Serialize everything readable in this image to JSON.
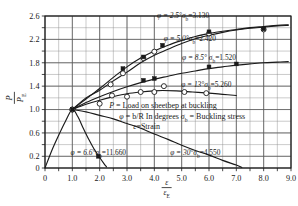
{
  "chart_data": {
    "type": "line",
    "title": "",
    "xlabel": "ε/ε_E",
    "ylabel": "P/P_E",
    "xlim": [
      0,
      9.0
    ],
    "ylim": [
      0,
      2.6
    ],
    "grid": true,
    "legend_position": "inline-annotations",
    "x_ticks": [
      "0",
      "1.0",
      "2.0",
      "3.0",
      "4.0",
      "5.0",
      "6.0",
      "7.0",
      "8.0",
      "9.0"
    ],
    "x_tick_values": [
      0,
      1,
      2,
      3,
      4,
      5,
      6,
      7,
      8,
      9
    ],
    "y_ticks": [
      "0",
      "0.2",
      "0.6",
      "1.0",
      "1.4",
      "1.8",
      "2.2",
      "2.6"
    ],
    "y_tick_values": [
      0,
      0.2,
      0.6,
      1.0,
      1.4,
      1.8,
      2.2,
      2.6
    ],
    "x_minor_step": 0.5,
    "y_minor_step": 0.2,
    "convergence_point": [
      1.0,
      1.0
    ],
    "series": [
      {
        "name": "φ = 2.5°  σb = 3.130",
        "phi_deg": 2.5,
        "sigma_b": 3.13,
        "marker": "open-circle",
        "points": [
          [
            1.0,
            1.0
          ],
          [
            2.4,
            1.43
          ],
          [
            2.85,
            1.62
          ],
          [
            3.6,
            1.88
          ],
          [
            4.0,
            1.99
          ],
          [
            6.0,
            2.3
          ],
          [
            8.0,
            2.37
          ]
        ],
        "curve": [
          [
            1.0,
            1.0
          ],
          [
            1.5,
            1.2
          ],
          [
            2.0,
            1.33
          ],
          [
            2.5,
            1.49
          ],
          [
            3.0,
            1.64
          ],
          [
            3.5,
            1.8
          ],
          [
            4.0,
            1.93
          ],
          [
            4.5,
            2.03
          ],
          [
            5.0,
            2.13
          ],
          [
            5.5,
            2.21
          ],
          [
            6.0,
            2.27
          ],
          [
            6.5,
            2.32
          ],
          [
            7.0,
            2.36
          ],
          [
            7.5,
            2.39
          ],
          [
            8.0,
            2.41
          ],
          [
            8.5,
            2.43
          ],
          [
            8.9,
            2.44
          ]
        ]
      },
      {
        "name": "φ = 5.0°  σb = 2.420",
        "phi_deg": 5.0,
        "sigma_b": 2.42,
        "marker": "filled-square",
        "points": [
          [
            1.0,
            1.0
          ],
          [
            2.85,
            1.7
          ],
          [
            3.6,
            1.9
          ],
          [
            4.3,
            2.1
          ],
          [
            6.0,
            2.33
          ],
          [
            8.0,
            2.38
          ]
        ],
        "curve": [
          [
            1.0,
            1.0
          ],
          [
            1.5,
            1.18
          ],
          [
            2.0,
            1.36
          ],
          [
            2.5,
            1.55
          ],
          [
            3.0,
            1.73
          ],
          [
            3.5,
            1.88
          ],
          [
            4.0,
            2.0
          ],
          [
            4.5,
            2.1
          ],
          [
            5.0,
            2.18
          ],
          [
            5.5,
            2.25
          ],
          [
            6.0,
            2.3
          ],
          [
            6.5,
            2.34
          ],
          [
            7.0,
            2.37
          ],
          [
            7.5,
            2.4
          ],
          [
            8.0,
            2.42
          ],
          [
            8.5,
            2.44
          ],
          [
            8.9,
            2.45
          ]
        ]
      },
      {
        "name": "φ = 8.5°  σb = 1.520",
        "phi_deg": 8.5,
        "sigma_b": 1.52,
        "marker": "filled-square",
        "points": [
          [
            1.0,
            1.0
          ],
          [
            3.6,
            1.5
          ],
          [
            4.0,
            1.53
          ],
          [
            6.0,
            1.73
          ],
          [
            7.0,
            1.78
          ]
        ],
        "curve": [
          [
            1.0,
            1.0
          ],
          [
            1.5,
            1.12
          ],
          [
            2.0,
            1.22
          ],
          [
            2.5,
            1.31
          ],
          [
            3.0,
            1.39
          ],
          [
            3.5,
            1.46
          ],
          [
            4.0,
            1.52
          ],
          [
            4.5,
            1.57
          ],
          [
            5.0,
            1.62
          ],
          [
            5.5,
            1.66
          ],
          [
            6.0,
            1.7
          ],
          [
            6.5,
            1.73
          ],
          [
            7.0,
            1.76
          ],
          [
            7.5,
            1.78
          ],
          [
            8.0,
            1.8
          ],
          [
            8.5,
            1.81
          ],
          [
            8.9,
            1.82
          ]
        ]
      },
      {
        "name": "φ = 13°  σb = 5.260",
        "phi_deg": 13,
        "sigma_b": 5.26,
        "marker": "open-circle",
        "points": [
          [
            1.0,
            1.0
          ],
          [
            2.0,
            1.1
          ],
          [
            2.45,
            1.24
          ],
          [
            3.0,
            1.22
          ],
          [
            3.5,
            1.3
          ],
          [
            4.0,
            1.3
          ],
          [
            4.35,
            1.4
          ],
          [
            5.1,
            1.3
          ],
          [
            5.9,
            1.28
          ]
        ],
        "curve": [
          [
            1.0,
            1.0
          ],
          [
            1.5,
            1.09
          ],
          [
            2.0,
            1.16
          ],
          [
            2.5,
            1.22
          ],
          [
            3.0,
            1.27
          ],
          [
            3.5,
            1.3
          ],
          [
            4.0,
            1.32
          ],
          [
            4.3,
            1.325
          ],
          [
            4.8,
            1.32
          ],
          [
            5.4,
            1.3
          ],
          [
            6.0,
            1.28
          ],
          [
            6.5,
            1.26
          ],
          [
            7.0,
            1.24
          ]
        ]
      },
      {
        "name": "φ = 6.6°  σb = 11.660",
        "phi_deg": 6.6,
        "sigma_b": 11.66,
        "marker": "filled-square",
        "points": [
          [
            1.0,
            1.0
          ],
          [
            1.95,
            0.2
          ]
        ],
        "curve": [
          [
            0.0,
            0.0
          ],
          [
            0.25,
            0.3
          ],
          [
            0.5,
            0.56
          ],
          [
            0.75,
            0.8
          ],
          [
            1.0,
            1.0
          ],
          [
            1.2,
            0.88
          ],
          [
            1.4,
            0.68
          ],
          [
            1.6,
            0.49
          ],
          [
            1.8,
            0.32
          ],
          [
            2.0,
            0.18
          ],
          [
            2.15,
            0.08
          ],
          [
            2.25,
            0.02
          ]
        ]
      },
      {
        "name": "φ = 30°  σb = 4.550",
        "phi_deg": 30,
        "sigma_b": 4.55,
        "marker": "none",
        "points": [
          [
            1.0,
            1.0
          ]
        ],
        "curve": [
          [
            1.0,
            1.0
          ],
          [
            1.5,
            0.96
          ],
          [
            2.0,
            0.9
          ],
          [
            2.5,
            0.84
          ],
          [
            3.0,
            0.76
          ],
          [
            3.5,
            0.68
          ],
          [
            4.0,
            0.58
          ],
          [
            4.5,
            0.49
          ],
          [
            5.0,
            0.39
          ],
          [
            5.5,
            0.3
          ],
          [
            6.0,
            0.22
          ],
          [
            6.5,
            0.13
          ],
          [
            7.0,
            0.05
          ],
          [
            7.2,
            0.01
          ]
        ]
      }
    ],
    "annotations": [
      {
        "id": "ann-phi-2p5",
        "text": "φ = 2.5°σb=3.130",
        "x": 5.05,
        "y": 2.57
      },
      {
        "id": "ann-phi-5p0",
        "text": "φ = 5.0°σb=2.420",
        "x": 5.3,
        "y": 2.18
      },
      {
        "id": "ann-phi-8p5",
        "text": "φ = 8.5° σb=1.520",
        "x": 6.0,
        "y": 1.84
      },
      {
        "id": "ann-phi-13",
        "text": "φ = 13°σb=5.260",
        "x": 5.9,
        "y": 1.38
      },
      {
        "id": "ann-phi-6p6",
        "text": "φ = 6.6°σb=11.660",
        "x": 1.95,
        "y": 0.23
      },
      {
        "id": "ann-phi-30",
        "text": "φ = 30°σb=4.550",
        "x": 5.5,
        "y": 0.23
      }
    ],
    "legend_lines": [
      "P = Load on sheetbep at buckling",
      "φ = b/R In degrees   σb = Buckling stress",
      "ε = Strain"
    ]
  },
  "axis": {
    "y_label_numerator": "P",
    "y_label_denominator": "P",
    "y_label_denominator_sub": "E",
    "x_label_numerator": "ε",
    "x_label_denominator": "ε",
    "x_label_denominator_sub": "E"
  },
  "legend": {
    "line1_symbol": "P",
    "line1_text": "= Load on sheetbep at buckling",
    "line2_symbol": "φ",
    "line2_text": "= b/R In degrees",
    "line2_symbol2": "σ",
    "line2_symbol2_sub": "b",
    "line2_text2": "= Buckling stress",
    "line3_symbol": "ε",
    "line3_text": "=Strain"
  },
  "colors": {
    "ink": "#1a1a1a",
    "grid": "#8a8a8a",
    "axis": "#1a1a1a",
    "background": "#ffffff"
  }
}
